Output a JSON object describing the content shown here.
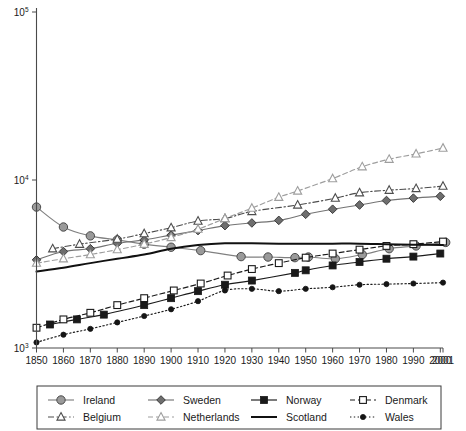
{
  "chart_data": {
    "type": "line",
    "title": "",
    "subtitle": "",
    "xlabel": "",
    "ylabel": "",
    "yscale": "log",
    "ylim": [
      1000,
      100000
    ],
    "xlim": [
      1850,
      2001
    ],
    "grid": false,
    "legend_position": "bottom",
    "y_tick_labels": [
      "10³",
      "10⁴",
      "10⁵"
    ],
    "y_ticks": [
      1000,
      10000,
      100000
    ],
    "y_tick_bases": [
      "10",
      "10",
      "10"
    ],
    "y_tick_exponents": [
      "3",
      "4",
      "5"
    ],
    "x_tick_labels": [
      "1850",
      "1860",
      "1870",
      "1880",
      "1890",
      "1900",
      "1910",
      "1920",
      "1930",
      "1940",
      "1950",
      "1960",
      "1970",
      "1980",
      "1990",
      "2000",
      "2001"
    ],
    "x_ticks": [
      1850,
      1860,
      1870,
      1880,
      1890,
      1900,
      1910,
      1920,
      1930,
      1940,
      1950,
      1960,
      1970,
      1980,
      1990,
      2000,
      2001
    ],
    "series": [
      {
        "name": "Ireland",
        "color": "#808080",
        "marker": "circle-filled",
        "dash": "none",
        "x": [
          1850,
          1860,
          1870,
          1880,
          1890,
          1900,
          1911,
          1926,
          1936,
          1946,
          1951,
          1961,
          1971,
          1981,
          1991,
          2002
        ],
        "values": [
          6900,
          5250,
          4650,
          4400,
          4150,
          3980,
          3800,
          3500,
          3480,
          3450,
          3480,
          3400,
          3600,
          3900,
          4050,
          4250
        ]
      },
      {
        "name": "Sweden",
        "color": "#737373",
        "marker": "diamond-filled",
        "dash": "none",
        "x": [
          1850,
          1860,
          1870,
          1880,
          1890,
          1900,
          1910,
          1920,
          1930,
          1940,
          1950,
          1960,
          1970,
          1980,
          1990,
          2000
        ],
        "values": [
          3350,
          3750,
          3900,
          4200,
          4400,
          4700,
          5000,
          5350,
          5550,
          5750,
          6250,
          6700,
          7100,
          7550,
          7800,
          8000
        ]
      },
      {
        "name": "Norway",
        "color": "#1a1a1a",
        "marker": "square-filled",
        "dash": "none",
        "x": [
          1855,
          1865,
          1875,
          1890,
          1900,
          1910,
          1920,
          1930,
          1946,
          1950,
          1960,
          1970,
          1980,
          1990,
          2000
        ],
        "values": [
          1380,
          1480,
          1580,
          1800,
          1980,
          2180,
          2380,
          2520,
          2800,
          2900,
          3100,
          3250,
          3400,
          3500,
          3650
        ]
      },
      {
        "name": "Denmark",
        "color": "#1a1a1a",
        "marker": "square-open",
        "dash": "dashed",
        "x": [
          1850,
          1860,
          1870,
          1880,
          1890,
          1901,
          1911,
          1921,
          1930,
          1940,
          1950,
          1960,
          1970,
          1980,
          1990,
          2001
        ],
        "values": [
          1320,
          1480,
          1620,
          1800,
          1980,
          2200,
          2420,
          2700,
          2950,
          3200,
          3450,
          3650,
          3850,
          4050,
          4150,
          4300
        ]
      },
      {
        "name": "Belgium",
        "color": "#4d4d4d",
        "marker": "triangle-open",
        "dash": "dashdot",
        "x": [
          1856,
          1866,
          1880,
          1890,
          1900,
          1910,
          1920,
          1930,
          1947,
          1961,
          1970,
          1981,
          1991,
          2001
        ],
        "values": [
          3900,
          4150,
          4450,
          4800,
          5200,
          5700,
          5900,
          6500,
          7100,
          7800,
          8400,
          8700,
          8900,
          9200
        ]
      },
      {
        "name": "Netherlands",
        "color": "#9e9e9e",
        "marker": "triangle-open",
        "dash": "dashed",
        "x": [
          1850,
          1860,
          1870,
          1880,
          1890,
          1900,
          1910,
          1920,
          1930,
          1940,
          1947,
          1960,
          1971,
          1981,
          1991,
          2001
        ],
        "values": [
          3200,
          3400,
          3600,
          3850,
          4150,
          4550,
          5100,
          5900,
          6800,
          7900,
          8600,
          10200,
          12000,
          13300,
          14300,
          15500
        ]
      },
      {
        "name": "Scotland",
        "color": "#111111",
        "marker": "none",
        "dash": "none",
        "x": [
          1850,
          1860,
          1870,
          1880,
          1890,
          1900,
          1910,
          1920,
          1930,
          1940,
          1950,
          1960,
          1970,
          1980,
          1990,
          2001
        ],
        "values": [
          2850,
          3000,
          3200,
          3400,
          3600,
          3900,
          4100,
          4200,
          4200,
          4180,
          4180,
          4180,
          4180,
          4150,
          4120,
          4100
        ]
      },
      {
        "name": "Wales",
        "color": "#1a1a1a",
        "marker": "circle-small-filled",
        "dash": "dotted",
        "x": [
          1850,
          1860,
          1870,
          1880,
          1890,
          1900,
          1910,
          1920,
          1930,
          1940,
          1950,
          1960,
          1970,
          1980,
          1990,
          2001
        ],
        "values": [
          1080,
          1200,
          1300,
          1420,
          1550,
          1700,
          1900,
          2200,
          2250,
          2180,
          2250,
          2300,
          2380,
          2400,
          2420,
          2450
        ]
      }
    ]
  },
  "legend": {
    "rows": [
      [
        {
          "label": "Ireland",
          "series": "Ireland"
        },
        {
          "label": "Sweden",
          "series": "Sweden"
        },
        {
          "label": "Norway",
          "series": "Norway"
        },
        {
          "label": "Denmark",
          "series": "Denmark"
        }
      ],
      [
        {
          "label": "Belgium",
          "series": "Belgium"
        },
        {
          "label": "Netherlands",
          "series": "Netherlands"
        },
        {
          "label": "Scotland",
          "series": "Scotland"
        },
        {
          "label": "Wales",
          "series": "Wales"
        }
      ]
    ]
  }
}
